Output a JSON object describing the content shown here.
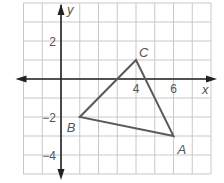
{
  "figure": {
    "type": "coordinate-plane-triangle",
    "grid": {
      "x_range": [
        -2,
        8
      ],
      "y_range": [
        -5,
        4
      ],
      "step": 1,
      "grid_color": "#c8c8c8",
      "axis_color": "#222222"
    },
    "axes": {
      "x_label": "x",
      "y_label": "y",
      "x_ticks": [
        {
          "value": 4,
          "label": "4"
        },
        {
          "value": 6,
          "label": "6"
        }
      ],
      "y_ticks": [
        {
          "value": 2,
          "label": "2"
        },
        {
          "value": -2,
          "label": "−2"
        },
        {
          "value": -4,
          "label": "−4"
        }
      ]
    },
    "triangle": {
      "stroke_color": "#5a5a5a",
      "vertices": [
        {
          "name": "A",
          "x": 6,
          "y": -3
        },
        {
          "name": "B",
          "x": 1,
          "y": -2
        },
        {
          "name": "C",
          "x": 4,
          "y": 1
        }
      ]
    }
  },
  "chart_data": {
    "type": "scatter",
    "title": "",
    "xlabel": "x",
    "ylabel": "y",
    "xlim": [
      -2,
      8
    ],
    "ylim": [
      -5,
      4
    ],
    "grid": true,
    "series": [
      {
        "name": "Triangle ABC",
        "points": [
          {
            "label": "A",
            "x": 6,
            "y": -3
          },
          {
            "label": "B",
            "x": 1,
            "y": -2
          },
          {
            "label": "C",
            "x": 4,
            "y": 1
          }
        ]
      }
    ],
    "x_tick_labels": [
      "4",
      "6"
    ],
    "y_tick_labels": [
      "2",
      "−2",
      "−4"
    ]
  }
}
